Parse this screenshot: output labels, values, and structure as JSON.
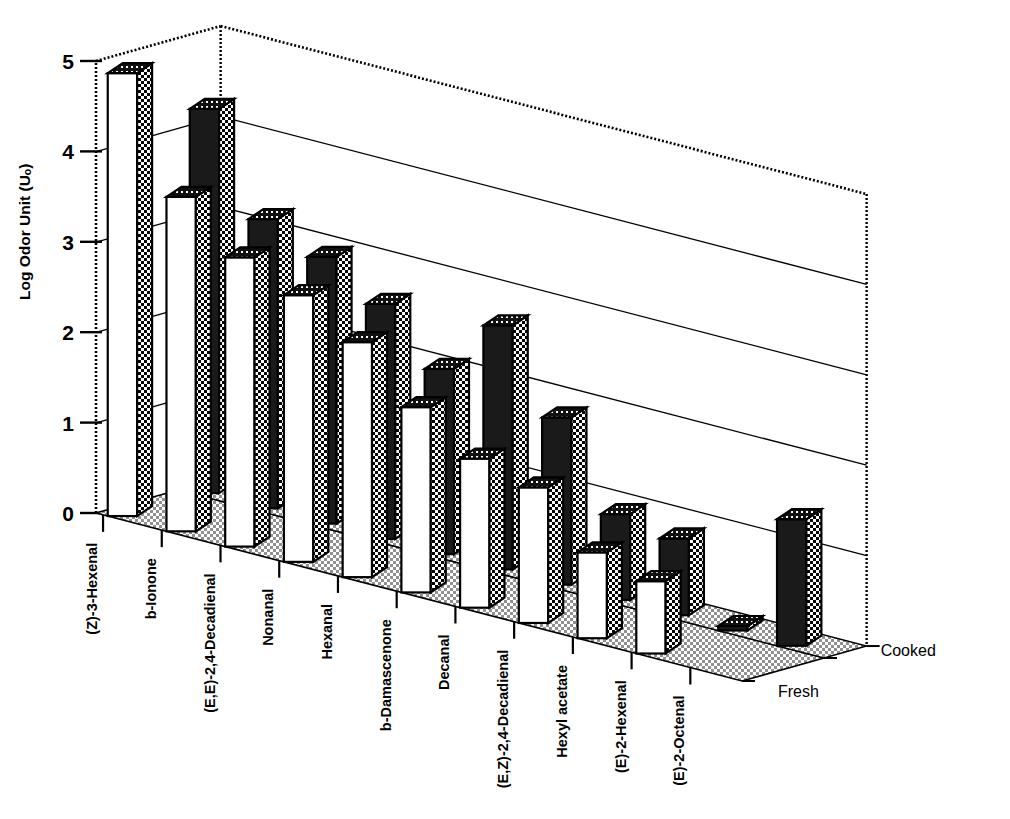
{
  "figure": {
    "yaxis_title": "Log Odor Unit (Uₒ)",
    "ytick_labels": [
      "5",
      "4",
      "3",
      "2",
      "1",
      "0"
    ],
    "series_labels": [
      "Cooked",
      "Fresh"
    ]
  },
  "colors": {
    "ink": "#000000",
    "fresh_face": "#ffffff",
    "cooked_face": "#1a1a1a",
    "checker_light": "#ffffff",
    "checker_dark": "#000000",
    "floor": "#bdbdbd",
    "gridline": "#000000"
  },
  "chart_data": {
    "type": "bar",
    "title": "",
    "subtitle": "",
    "xlabel": "",
    "ylabel": "Log Odor Unit (Uₒ)",
    "ylim": [
      0,
      5
    ],
    "yticks": [
      0,
      1,
      2,
      3,
      4,
      5
    ],
    "grid": true,
    "legend_position": "right-bottom",
    "projection": "3d-two-row",
    "categories": [
      "(Z)-3-Hexenal",
      "b-Ionone",
      "(E,E)-2,4-Decadienal",
      "Nonanal",
      "Hexanal",
      "b-Damascenone",
      "Decanal",
      "(E,Z)-2,4-Decadienal",
      "Hexyl acetate",
      "(E)-2-Hexenal",
      "(E)-2-Octenal"
    ],
    "series": [
      {
        "name": "Fresh",
        "style": "white-front-row",
        "values": [
          4.9,
          3.7,
          3.2,
          2.95,
          2.6,
          2.05,
          1.65,
          1.5,
          0.95,
          0.8,
          0.0
        ]
      },
      {
        "name": "Cooked",
        "style": "dark-back-row",
        "values": [
          4.25,
          3.2,
          2.95,
          2.6,
          2.05,
          2.7,
          1.85,
          0.95,
          0.85,
          0.05,
          1.4
        ]
      }
    ]
  }
}
